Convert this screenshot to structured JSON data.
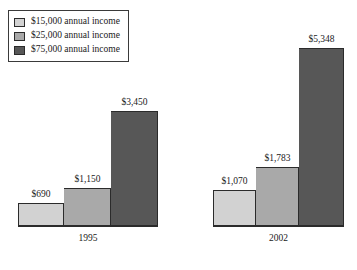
{
  "legend": {
    "items": [
      {
        "label": "$15,000 annual income",
        "color": "#d2d2d2",
        "icon": "color-swatch-icon"
      },
      {
        "label": "$25,000 annual income",
        "color": "#a9a9a9",
        "icon": "color-swatch-icon"
      },
      {
        "label": "$75,000 annual income",
        "color": "#575757",
        "icon": "color-swatch-icon"
      }
    ]
  },
  "chart_data": {
    "type": "bar",
    "title": "",
    "xlabel": "",
    "ylabel": "",
    "categories": [
      "1995",
      "2002"
    ],
    "series": [
      {
        "name": "$15,000 annual income",
        "color": "#d2d2d2",
        "values": [
          690,
          1070
        ],
        "labels": [
          "$690",
          "$1,070"
        ]
      },
      {
        "name": "$25,000 annual income",
        "color": "#a9a9a9",
        "values": [
          1150,
          1783
        ],
        "labels": [
          "$1,150",
          "$1,783"
        ]
      },
      {
        "name": "$75,000 annual income",
        "color": "#575757",
        "values": [
          3450,
          5348
        ],
        "labels": [
          "$3,450",
          "$5,348"
        ]
      }
    ],
    "ylim": [
      0,
      5348
    ],
    "grid": false,
    "legend_position": "top-left",
    "value_labels": true,
    "groups": [
      {
        "category": "1995",
        "bars": [
          {
            "series": "$15,000 annual income",
            "value": 690,
            "label": "$690",
            "color": "#d2d2d2"
          },
          {
            "series": "$25,000 annual income",
            "value": 1150,
            "label": "$1,150",
            "color": "#a9a9a9"
          },
          {
            "series": "$75,000 annual income",
            "value": 3450,
            "label": "$3,450",
            "color": "#575757"
          }
        ]
      },
      {
        "category": "2002",
        "bars": [
          {
            "series": "$15,000 annual income",
            "value": 1070,
            "label": "$1,070",
            "color": "#d2d2d2"
          },
          {
            "series": "$25,000 annual income",
            "value": 1783,
            "label": "$1,783",
            "color": "#a9a9a9"
          },
          {
            "series": "$75,000 annual income",
            "value": 5348,
            "label": "$5,348",
            "color": "#575757"
          }
        ]
      }
    ]
  }
}
